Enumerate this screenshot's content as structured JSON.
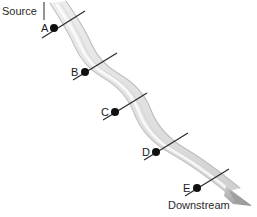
{
  "figure": {
    "type": "river-transect-diagram",
    "background_color": "#ffffff",
    "source_label": "Source",
    "downstream_label": "Downstream",
    "river_color_light": "#f2f2f2",
    "river_color_mid": "#d8d8d8",
    "river_color_dark": "#b4b4b4",
    "transect_color": "#2e2e2e",
    "point_color": "#101010",
    "arrow_color": "#9a9a9a"
  },
  "labels": {
    "source": {
      "text": "Source",
      "x": 2,
      "y": 6
    },
    "downstream": {
      "text": "Downstream",
      "x": 168,
      "y": 200
    }
  },
  "source_tick": {
    "x": 44,
    "y1": 2,
    "y2": 20
  },
  "points": [
    {
      "id": "A",
      "label": "A",
      "dot_x": 54,
      "dot_y": 28,
      "label_x": 41,
      "label_y": 23,
      "transect": {
        "x1": 42,
        "y1": 38,
        "x2": 85,
        "y2": 11
      }
    },
    {
      "id": "B",
      "label": "B",
      "dot_x": 85,
      "dot_y": 72,
      "label_x": 71,
      "label_y": 67,
      "transect": {
        "x1": 73,
        "y1": 80,
        "x2": 117,
        "y2": 53
      }
    },
    {
      "id": "C",
      "label": "C",
      "dot_x": 115,
      "dot_y": 112,
      "label_x": 101,
      "label_y": 107,
      "transect": {
        "x1": 103,
        "y1": 120,
        "x2": 147,
        "y2": 93
      }
    },
    {
      "id": "D",
      "label": "D",
      "dot_x": 156,
      "dot_y": 152,
      "label_x": 142,
      "label_y": 147,
      "transect": {
        "x1": 144,
        "y1": 160,
        "x2": 188,
        "y2": 133
      }
    },
    {
      "id": "E",
      "label": "E",
      "dot_x": 197,
      "dot_y": 188,
      "label_x": 183,
      "label_y": 183,
      "transect": {
        "x1": 185,
        "y1": 196,
        "x2": 229,
        "y2": 169
      }
    }
  ],
  "river": {
    "center_path": "M 58 3 C 68 18, 76 30, 82 44 C 88 58, 96 68, 110 76 C 124 84, 136 96, 142 112 C 148 128, 160 142, 178 152 C 196 162, 212 174, 232 190",
    "left_bank": "M 52 4 C 62 19, 70 31, 76 45 C 82 59, 90 69, 104 77 C 118 85, 130 97, 136 113 C 142 129, 154 143, 172 153 C 190 163, 206 175, 226 191",
    "right_bank": "M 64 2 C 74 17, 82 29, 88 43 C 94 57, 102 67, 116 75 C 130 83, 142 95, 148 111 C 154 127, 166 141, 184 151 C 202 161, 218 173, 238 189",
    "flow_arrow": {
      "tip_x": 250,
      "tip_y": 203
    }
  }
}
